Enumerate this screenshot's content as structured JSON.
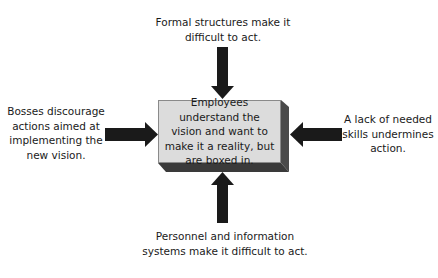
{
  "diagram": {
    "center": {
      "text": "Employees understand the vision and want to make it a reality, but are boxed in."
    },
    "barriers": {
      "top": "Formal structures make it difficult to act.",
      "left": "Bosses discourage actions aimed at implementing the new vision.",
      "right": "A lack of needed skills undermines action.",
      "bottom": "Personnel and information systems make it difficult to act."
    },
    "colors": {
      "arrow": "#1a1a1a",
      "box_face": "#dcdcdc",
      "box_side": "#4a4a4a",
      "box_bottom": "#3a3a3a"
    }
  }
}
